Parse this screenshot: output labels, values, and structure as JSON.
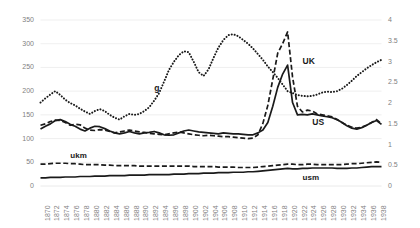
{
  "chart": {
    "title": "",
    "background": "#ffffff",
    "gridline_color": "#e8e8e8",
    "axis_text_color": "#7f7f7f",
    "series_color": "#1a1a1a"
  },
  "chart_data": {
    "type": "line",
    "title": "",
    "subtitle": "",
    "xlabel": "",
    "ylabel": "",
    "y2label": "",
    "grid": true,
    "legend_position": "inline-annotations",
    "xlim": [
      1870,
      1939
    ],
    "ylim": [
      0,
      350
    ],
    "y2lim": [
      0,
      4
    ],
    "yticks": [
      0,
      50,
      100,
      150,
      200,
      250,
      300,
      350
    ],
    "y2ticks": [
      0,
      0.5,
      1,
      1.5,
      2,
      2.5,
      3,
      3.5,
      4
    ],
    "x": [
      1870,
      1871,
      1872,
      1873,
      1874,
      1875,
      1876,
      1877,
      1878,
      1879,
      1880,
      1881,
      1882,
      1883,
      1884,
      1885,
      1886,
      1887,
      1888,
      1889,
      1890,
      1891,
      1892,
      1893,
      1894,
      1895,
      1896,
      1897,
      1898,
      1899,
      1900,
      1901,
      1902,
      1903,
      1904,
      1905,
      1906,
      1907,
      1908,
      1909,
      1910,
      1911,
      1912,
      1913,
      1914,
      1915,
      1916,
      1917,
      1918,
      1919,
      1920,
      1921,
      1922,
      1923,
      1924,
      1925,
      1926,
      1927,
      1928,
      1929,
      1930,
      1931,
      1932,
      1933,
      1934,
      1935,
      1936,
      1937,
      1938,
      1939
    ],
    "xticks": [
      1870,
      1872,
      1874,
      1876,
      1878,
      1880,
      1882,
      1884,
      1886,
      1888,
      1890,
      1892,
      1894,
      1896,
      1898,
      1900,
      1902,
      1904,
      1906,
      1908,
      1910,
      1912,
      1914,
      1916,
      1918,
      1920,
      1922,
      1924,
      1926,
      1928,
      1930,
      1932,
      1934,
      1936,
      1938
    ],
    "series": [
      {
        "name": "g",
        "label": "g",
        "axis": "left",
        "style": "dotted",
        "color": "#1a1a1a",
        "values": [
          176,
          185,
          193,
          200,
          192,
          182,
          175,
          170,
          163,
          157,
          152,
          158,
          162,
          158,
          150,
          144,
          140,
          147,
          152,
          150,
          152,
          158,
          166,
          180,
          196,
          220,
          245,
          262,
          276,
          284,
          282,
          262,
          240,
          232,
          246,
          270,
          292,
          308,
          318,
          320,
          316,
          308,
          300,
          290,
          278,
          266,
          252,
          240,
          228,
          214,
          200,
          196,
          192,
          190,
          189,
          190,
          193,
          197,
          199,
          198,
          200,
          205,
          213,
          222,
          232,
          240,
          248,
          255,
          261,
          266
        ]
      },
      {
        "name": "UK",
        "label": "UK",
        "axis": "left",
        "style": "dashed",
        "color": "#1a1a1a",
        "values": [
          128,
          131,
          136,
          139,
          138,
          134,
          128,
          130,
          129,
          122,
          118,
          117,
          119,
          118,
          115,
          112,
          114,
          116,
          118,
          116,
          114,
          113,
          111,
          110,
          109,
          108,
          110,
          112,
          114,
          112,
          110,
          108,
          107,
          106,
          107,
          106,
          105,
          104,
          104,
          103,
          102,
          101,
          100,
          101,
          108,
          132,
          170,
          225,
          280,
          300,
          325,
          230,
          168,
          156,
          160,
          158,
          152,
          150,
          148,
          146,
          140,
          134,
          128,
          124,
          122,
          124,
          128,
          134,
          140,
          131
        ]
      },
      {
        "name": "US",
        "label": "US",
        "axis": "left",
        "style": "solid",
        "color": "#1a1a1a",
        "values": [
          120,
          126,
          131,
          138,
          140,
          136,
          130,
          126,
          120,
          116,
          122,
          126,
          125,
          121,
          116,
          112,
          110,
          112,
          115,
          112,
          110,
          112,
          113,
          115,
          112,
          108,
          107,
          108,
          112,
          116,
          118,
          116,
          114,
          113,
          112,
          111,
          110,
          112,
          111,
          110,
          110,
          109,
          108,
          108,
          112,
          118,
          134,
          168,
          208,
          236,
          255,
          176,
          150,
          151,
          150,
          152,
          150,
          148,
          146,
          144,
          140,
          134,
          127,
          122,
          120,
          123,
          128,
          134,
          138,
          130
        ]
      },
      {
        "name": "ukm",
        "label": "ukm",
        "axis": "left",
        "style": "dashed",
        "color": "#1a1a1a",
        "values": [
          46,
          46,
          47,
          48,
          48,
          48,
          47,
          47,
          46,
          45,
          45,
          45,
          45,
          44,
          44,
          43,
          43,
          43,
          43,
          43,
          42,
          42,
          42,
          42,
          42,
          42,
          42,
          42,
          42,
          42,
          42,
          41,
          41,
          41,
          41,
          41,
          40,
          40,
          40,
          40,
          39,
          39,
          39,
          39,
          40,
          41,
          42,
          43,
          44,
          45,
          46,
          46,
          45,
          45,
          46,
          46,
          45,
          45,
          45,
          45,
          45,
          45,
          46,
          47,
          47,
          48,
          49,
          50,
          51,
          50
        ]
      },
      {
        "name": "usm",
        "label": "usm",
        "axis": "left",
        "style": "solid",
        "color": "#1a1a1a",
        "values": [
          17,
          17,
          18,
          18,
          18,
          19,
          19,
          19,
          20,
          20,
          20,
          21,
          21,
          21,
          22,
          22,
          22,
          22,
          23,
          23,
          23,
          23,
          24,
          24,
          24,
          24,
          24,
          25,
          25,
          25,
          26,
          26,
          26,
          27,
          27,
          27,
          28,
          28,
          28,
          29,
          29,
          29,
          30,
          30,
          31,
          32,
          33,
          34,
          35,
          36,
          37,
          36,
          36,
          37,
          37,
          38,
          38,
          38,
          38,
          38,
          37,
          37,
          37,
          38,
          38,
          39,
          40,
          41,
          41,
          41
        ]
      }
    ],
    "annotations": [
      {
        "text": "g",
        "x": 1893,
        "y": 205
      },
      {
        "text": "UK",
        "x": 1923,
        "y": 262
      },
      {
        "text": "US",
        "x": 1925,
        "y": 132
      },
      {
        "text": "ukm",
        "x": 1876,
        "y": 62
      },
      {
        "text": "usm",
        "x": 1923,
        "y": 14
      }
    ]
  },
  "axes": {
    "left_ticks": [
      "350",
      "300",
      "250",
      "200",
      "150",
      "100",
      "50",
      "0"
    ],
    "right_ticks": [
      "4",
      "3.5",
      "3",
      "2.5",
      "2",
      "1.5",
      "1",
      "0.5",
      "0"
    ],
    "x_ticks": [
      "1870",
      "1872",
      "1874",
      "1876",
      "1878",
      "1880",
      "1882",
      "1884",
      "1886",
      "1888",
      "1890",
      "1892",
      "1894",
      "1896",
      "1898",
      "1900",
      "1902",
      "1904",
      "1906",
      "1908",
      "1910",
      "1912",
      "1914",
      "1916",
      "1918",
      "1920",
      "1922",
      "1924",
      "1926",
      "1928",
      "1930",
      "1932",
      "1934",
      "1936",
      "1938"
    ]
  }
}
